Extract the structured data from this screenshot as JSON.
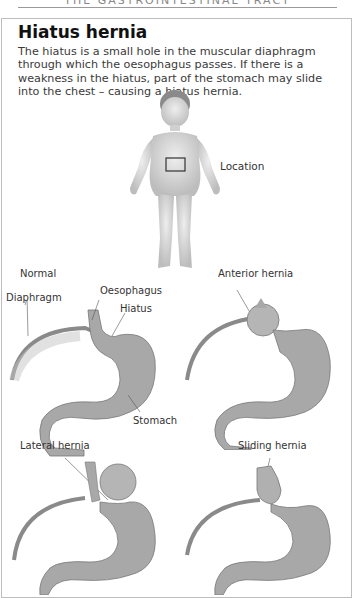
{
  "page": {
    "running_header": "THE GASTROINTESTINAL TRACT",
    "title": "Hiatus hernia",
    "intro": "The hiatus is a small hole in the muscular diaphragm through which the oesophagus passes. If there is a weakness in the hiatus, part of the stomach may slide into the chest – causing a hiatus hernia."
  },
  "figure_child": {
    "location_label": "Location"
  },
  "panels": {
    "normal": {
      "title": "Normal",
      "labels": {
        "diaphragm": "Diaphragm",
        "oesophagus": "Oesophagus",
        "hiatus": "Hiatus",
        "stomach": "Stomach"
      }
    },
    "anterior": {
      "title": "Anterior hernia"
    },
    "lateral": {
      "title": "Lateral hernia"
    },
    "sliding": {
      "title": "Sliding hernia"
    }
  },
  "colors": {
    "frame": "#bdbdbd",
    "skin": "#d6d6d6",
    "stomach": "#a8a8a8",
    "diaphragm": "#8a8a8a"
  }
}
